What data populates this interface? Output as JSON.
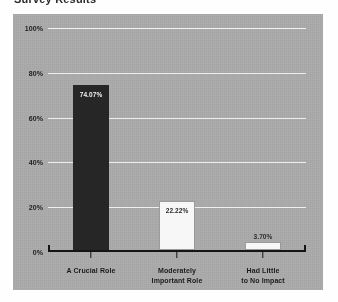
{
  "heading": {
    "text": "Survey Results"
  },
  "chart_data": {
    "type": "bar",
    "title": "",
    "xlabel": "",
    "ylabel": "",
    "ylim": [
      0,
      100
    ],
    "grid": true,
    "legend": "none",
    "ytick_labels": [
      "100%",
      "80%",
      "60%",
      "40%",
      "20%",
      "0%"
    ],
    "ytick_values": [
      100,
      80,
      60,
      40,
      20,
      0
    ],
    "categories": [
      "A Crucial Role",
      "Moderately Important Role",
      "Had Little to No Impact"
    ],
    "category_lines": [
      [
        "A Crucial Role"
      ],
      [
        "Moderately",
        "Important Role"
      ],
      [
        "Had Little",
        "to No Impact"
      ]
    ],
    "values": [
      74.07,
      22.22,
      3.7
    ],
    "value_labels": [
      "74.07%",
      "22.22%",
      "3.70%"
    ],
    "bar_colors": [
      "#262626",
      "#f7f7f7",
      "#f7f7f7"
    ],
    "label_placement": [
      "inside",
      "inside",
      "above"
    ]
  },
  "colors": {
    "panel_background": "#a9a9a9",
    "grid_line": "#efefef",
    "axis": "#141414",
    "bar_dark": "#262626",
    "bar_light": "#f7f7f7",
    "text": "#1b1b1b"
  }
}
